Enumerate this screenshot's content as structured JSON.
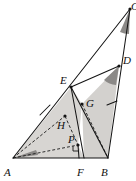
{
  "figure": {
    "type": "geometry-diagram",
    "background_color": "#ffffff",
    "stroke_color": "#1a1a1a",
    "fill_light": "#d8d6d3",
    "fill_medium": "#c9c7c4",
    "fill_dark": "#8e8c8a",
    "width": 136,
    "height": 181,
    "points": [
      {
        "id": "A",
        "label": "A",
        "x": 13,
        "y": 158,
        "label_x": 6,
        "label_y": 175,
        "dot": false
      },
      {
        "id": "B",
        "label": "B",
        "x": 108,
        "y": 158,
        "label_x": 101,
        "label_y": 175,
        "dot": false
      },
      {
        "id": "C",
        "label": "C",
        "x": 130,
        "y": 9,
        "label_x": 130,
        "label_y": 9,
        "dot": true
      },
      {
        "id": "D",
        "label": "D",
        "x": 119,
        "y": 66,
        "label_x": 124,
        "label_y": 66,
        "dot": true
      },
      {
        "id": "E",
        "label": "E",
        "x": 71,
        "y": 87,
        "label_x": 62,
        "label_y": 82,
        "dot": true
      },
      {
        "id": "F",
        "label": "F",
        "x": 84,
        "y": 158,
        "label_x": 78,
        "label_y": 175,
        "dot": false
      },
      {
        "id": "G",
        "label": "G",
        "x": 82,
        "y": 104,
        "label_x": 86,
        "label_y": 104,
        "dot": true
      },
      {
        "id": "H",
        "label": "H",
        "x": 65,
        "y": 116,
        "label_x": 59,
        "label_y": 125,
        "dot": true
      },
      {
        "id": "P",
        "label": "P",
        "x": 78,
        "y": 145,
        "label_x": 70,
        "label_y": 143,
        "dot": true
      }
    ],
    "solid_segments": [
      {
        "name": "side-AB",
        "from": "A",
        "to": "B"
      },
      {
        "name": "side-AC",
        "from": "A",
        "to": "C"
      },
      {
        "name": "side-BC",
        "from": "B",
        "to": "C"
      },
      {
        "name": "segment-EF",
        "from": "E",
        "to": "F"
      },
      {
        "name": "segment-BE",
        "from": "B",
        "to": "E"
      },
      {
        "name": "segment-PF",
        "from": "P",
        "to": "F"
      }
    ],
    "dashed_segments": [
      {
        "name": "segment-AP",
        "from": "A",
        "to": "P"
      },
      {
        "name": "segment-AH",
        "from": "A",
        "to": "H"
      },
      {
        "name": "segment-GB",
        "from": "G",
        "to": "B"
      },
      {
        "name": "segment-HP",
        "from": "H",
        "to": "P"
      }
    ],
    "shaded_regions": [
      {
        "name": "region-A-E-G-H-P",
        "tone": "light",
        "vertices": [
          "A",
          "E",
          "G",
          "P"
        ]
      },
      {
        "name": "region-G-D-B",
        "tone": "light",
        "vertices": [
          "G",
          "D",
          "B",
          "F"
        ]
      },
      {
        "name": "angle-wedge-A",
        "tone": "dark"
      },
      {
        "name": "angle-wedge-C",
        "tone": "dark"
      },
      {
        "name": "angle-wedge-D",
        "tone": "dark"
      }
    ],
    "tick_marks": [
      {
        "name": "tick-on-AE",
        "x": 45,
        "y": 110
      },
      {
        "name": "tick-on-BD",
        "x": 112,
        "y": 103
      }
    ],
    "right_angle_marks": [
      {
        "name": "right-angle-at-P",
        "x": 78,
        "y": 145
      }
    ]
  }
}
